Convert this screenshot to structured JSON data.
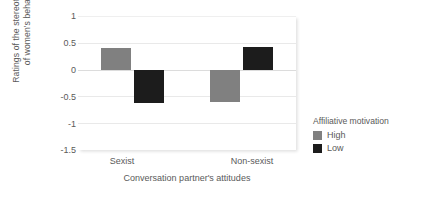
{
  "chart_data": {
    "type": "bar",
    "title": "",
    "xlabel": "Conversation partner's attitudes",
    "ylabel": "Ratings of the stereotypicality of women's behavior",
    "ylabel_lines": [
      "Ratings of the stereotypicality",
      "of women's behavior"
    ],
    "categories": [
      "Sexist",
      "Non-sexist"
    ],
    "series": [
      {
        "name": "High",
        "color": "#808080",
        "values": [
          0.4,
          -0.6
        ]
      },
      {
        "name": "Low",
        "color": "#1c1c1c",
        "values": [
          -0.63,
          0.42
        ]
      }
    ],
    "ylim": [
      -1.5,
      1
    ],
    "yticks": [
      1,
      0.5,
      0,
      -0.5,
      -1,
      -1.5
    ],
    "ytick_labels": [
      "1",
      "0.5",
      "0",
      "-0.5",
      "-1",
      "-1.5"
    ],
    "grid": true,
    "legend": {
      "title": "Affiliative motivation",
      "position": "right",
      "entries": [
        {
          "label": "High",
          "color": "#808080"
        },
        {
          "label": "Low",
          "color": "#1c1c1c"
        }
      ]
    }
  }
}
